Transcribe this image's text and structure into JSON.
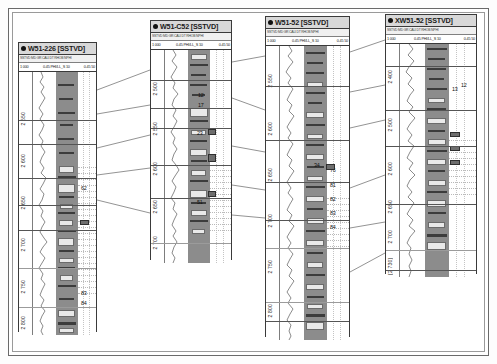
{
  "panel": {
    "title": "Well log correlation panel",
    "background_color": "#ffffff",
    "frame_color": "#6a6a6a"
  },
  "tracks": [
    {
      "id": "track-1",
      "title": "W51-226 [SSTVD]",
      "header_micro": "SSTVD  MD  GR  CALI  DT  RHOB  NPHI",
      "scale_left": "1 000",
      "scale_mid": "0.45   PHI/LL_S   10",
      "scale_right": "0.45   50",
      "depth_labels": [
        "2 550",
        "2 600",
        "2 650",
        "2 700",
        "2 750",
        "2 800"
      ],
      "zone_numbers": [
        "62",
        "83",
        "84"
      ]
    },
    {
      "id": "track-2",
      "title": "W51-C52 [SSTVD]",
      "header_micro": "SSTVD  MD  GR  CALI  DT  RHOB  NPHI",
      "scale_left": "1 000",
      "scale_mid": "0.45   PHI/LL_S   10",
      "scale_right": "0.45   50",
      "depth_labels": [
        "2 500",
        "2 550",
        "2 600",
        "2 650",
        "2 700"
      ],
      "zone_numbers": [
        "12",
        "17",
        "23",
        "51"
      ]
    },
    {
      "id": "track-3",
      "title": "W51-52 [SSTVD]",
      "header_micro": "SSTVD  MD  GR  CALI  DT  RHOB  NPHI",
      "scale_left": "1 000",
      "scale_mid": "0.45   PHI/LL_S   10",
      "scale_right": "0.45   50",
      "depth_labels": [
        "2 550",
        "2 600",
        "2 650",
        "2 700",
        "2 750",
        "2 800"
      ],
      "zone_numbers": [
        "34",
        "76",
        "81",
        "82",
        "83",
        "84"
      ]
    },
    {
      "id": "track-4",
      "title": "XW51-52 [SSTVD]",
      "header_micro": "SSTVD  MD  GR  CALI  DT  RHOB  NPHI",
      "scale_left": "1 000",
      "scale_mid": "0.45   PHI/LL_S   10",
      "scale_right": "0.45   50",
      "depth_labels": [
        "2 400",
        "2 500",
        "2 600",
        "2 650",
        "2 700",
        "[2 730]"
      ],
      "zone_numbers": [
        "12",
        "13"
      ]
    }
  ],
  "colors": {
    "litho_fill": "#8c8c8c",
    "litho_dark": "#3c3c3c",
    "litho_light": "#e9e9e9",
    "marker_line": "#555555",
    "tie_line": "#4a4a4a",
    "title_bar": "#d8d8d8"
  }
}
